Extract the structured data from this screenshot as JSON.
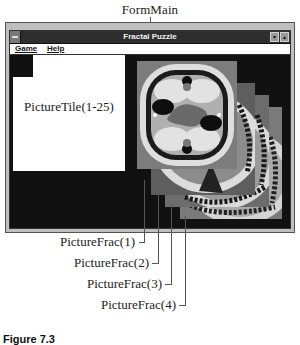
{
  "callouts": {
    "form_main": "FormMain",
    "picture_tile": "PictureTile(1-25)",
    "picture_frac": [
      "PictureFrac(1)",
      "PictureFrac(2)",
      "PictureFrac(3)",
      "PictureFrac(4)"
    ]
  },
  "window": {
    "title": "Fractal Puzzle",
    "system_menu_icon": "system-menu-icon",
    "minimize_glyph": "▾",
    "maximize_glyph": "▴"
  },
  "menubar": {
    "items": [
      {
        "label": "Game"
      },
      {
        "label": "Help"
      }
    ]
  },
  "caption": "Figure 7.3",
  "colors": {
    "titlebar": "#2e2e2e",
    "client_background": "#111111",
    "picture_tile_background": "#ffffff",
    "fractal_gray": "#8a8a8a",
    "fractal_light": "#d8d8d8",
    "fractal_dark": "#1a1a1a"
  }
}
